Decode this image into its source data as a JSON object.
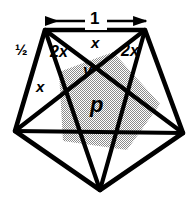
{
  "figure": {
    "background_color": "#ffffff",
    "stroke_color": "#000000",
    "shaded_fill_color": "#a8a8a8",
    "shaded_pattern": "checkerboard-dither"
  },
  "dimension": {
    "top_measure_label": "1",
    "arrow_left_x": 45,
    "arrow_right_x": 147,
    "arrow_y": 21
  },
  "labels": {
    "side_half": "½",
    "angle_2x_left": "2x",
    "angle_2x_right": "2x",
    "angle_x_top": "x",
    "angle_x_left": "x",
    "segment_y": "y",
    "area_p": "p"
  },
  "geometry": {
    "outer_pentagon": [
      [
        45,
        30
      ],
      [
        145,
        30
      ],
      [
        183,
        133
      ],
      [
        100,
        190
      ],
      [
        15,
        131
      ]
    ],
    "inner_pentagon": [
      [
        59,
        72
      ],
      [
        113,
        52
      ],
      [
        160,
        104
      ],
      [
        127,
        150
      ],
      [
        63,
        141
      ]
    ],
    "chords": [
      [
        [
          45,
          30
        ],
        [
          183,
          133
        ]
      ],
      [
        [
          145,
          30
        ],
        [
          100,
          190
        ]
      ],
      [
        [
          183,
          133
        ],
        [
          15,
          131
        ]
      ],
      [
        [
          100,
          190
        ],
        [
          45,
          30
        ]
      ],
      [
        [
          15,
          131
        ],
        [
          145,
          30
        ]
      ]
    ]
  }
}
